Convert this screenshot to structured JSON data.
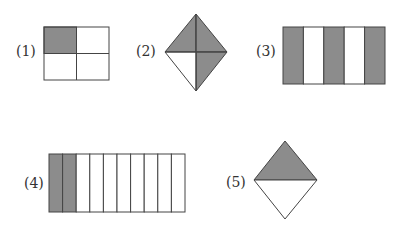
{
  "figures": [
    {
      "id": 1,
      "label": "(1)",
      "shape": "rectangle",
      "parts": 4,
      "shaded": 1
    },
    {
      "id": 2,
      "label": "(2)",
      "shape": "diamond",
      "parts": 4,
      "shaded": 3
    },
    {
      "id": 3,
      "label": "(3)",
      "shape": "rectangle-strips",
      "parts": 5,
      "shaded": 3
    },
    {
      "id": 4,
      "label": "(4)",
      "shape": "rectangle-strips",
      "parts": 10,
      "shaded": 2
    },
    {
      "id": 5,
      "label": "(5)",
      "shape": "diamond",
      "parts": 2,
      "shaded": 1
    }
  ],
  "colors": {
    "shade": "#8c8c8c",
    "stroke": "#444444",
    "fill": "#ffffff"
  }
}
